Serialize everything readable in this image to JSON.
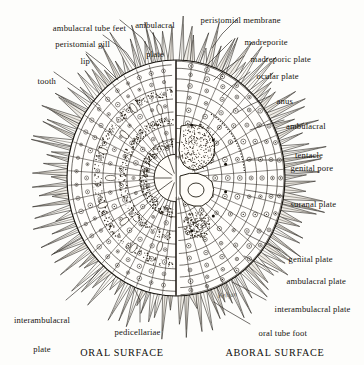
{
  "figure": {
    "background_color": "#fdfdfb",
    "ink_color": "#16130f"
  },
  "captions": [
    {
      "id": "oral",
      "text": "ORAL SURFACE"
    },
    {
      "id": "aboral",
      "text": "ABORAL SURFACE"
    }
  ],
  "signature": {
    "text": "Kelljan"
  },
  "labels": {
    "left": [
      {
        "id": "ambulacral-tube-feet",
        "text": "ambulacral tube feet"
      },
      {
        "id": "peristomial-gill",
        "text": "peristomial gill"
      },
      {
        "id": "lip",
        "text": "lip"
      },
      {
        "id": "tooth",
        "text": "tooth"
      },
      {
        "id": "interambulacral-plate-oral",
        "line1": "interambulacral",
        "line2": "plate"
      },
      {
        "id": "pedicellariae",
        "text": "pedicellariae"
      }
    ],
    "top": [
      {
        "id": "ambulacral-plate-top",
        "line1": "ambulacral",
        "line2": "plate"
      },
      {
        "id": "peristomial-membrane",
        "text": "peristomial membrane"
      }
    ],
    "right": [
      {
        "id": "madreporite",
        "text": "madreporite"
      },
      {
        "id": "madreporic-plate",
        "text": "madreporic plate"
      },
      {
        "id": "ocular-plate",
        "text": "ocular plate"
      },
      {
        "id": "anus",
        "text": "anus"
      },
      {
        "id": "ambulacral-tentacle",
        "line1": "ambulacral",
        "line2": "tentacle"
      },
      {
        "id": "genital-pore",
        "text": "genital pore"
      },
      {
        "id": "suranal-plate",
        "text": "suranal plate"
      },
      {
        "id": "genital-plate",
        "text": "genital plate"
      },
      {
        "id": "ambulacral-plate-right",
        "text": "ambulacral plate"
      },
      {
        "id": "interambulacral-plate-aboral",
        "text": "interambulacral plate"
      },
      {
        "id": "oral-tube-foot",
        "text": "oral tube foot"
      }
    ]
  }
}
